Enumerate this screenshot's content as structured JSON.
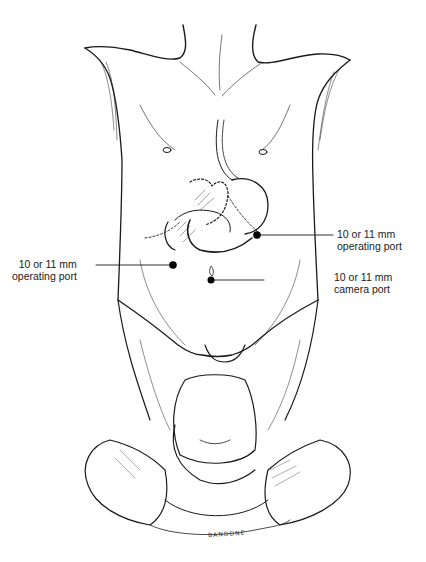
{
  "figure": {
    "artist_signature": "BANDONE",
    "colors": {
      "line": "#1a1a1a",
      "port": "#000000",
      "background": "#ffffff"
    }
  },
  "callouts": [
    {
      "id": "right-operating-port",
      "line1": "10 or 11 mm",
      "line2": "operating port",
      "side": "right"
    },
    {
      "id": "left-operating-port",
      "line1": "10 or 11 mm",
      "line2": "operating port",
      "side": "left"
    },
    {
      "id": "camera-port",
      "line1": "10 or 11 mm",
      "line2": "camera port",
      "side": "right"
    }
  ]
}
